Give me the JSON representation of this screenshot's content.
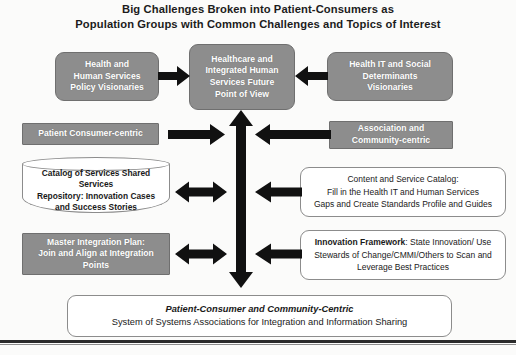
{
  "title": {
    "line1": "Big Challenges Broken into  Patient-Consumers as",
    "line2": "Population Groups with Common  Challenges and Topics of Interest"
  },
  "colors": {
    "gray_fill": "#8d8d8d",
    "gray_border": "#6f6f6f",
    "white_fill": "#ffffff",
    "white_border": "#8c8c8c",
    "arrow_fill": "#111111",
    "text_dark": "#1a1a1a",
    "text_light": "#ffffff"
  },
  "nodes": {
    "hhs_policy": {
      "lines": [
        "Health  and",
        "Human Services",
        "Policy Visionaries"
      ]
    },
    "center_vision": {
      "lines": [
        "Healthcare and",
        "Integrated Human",
        "Services Future",
        "Point of View"
      ]
    },
    "health_it_social": {
      "lines": [
        "Health IT and Social",
        "Determinants",
        "Visionaries"
      ]
    },
    "patient_consumer_centric": {
      "lines": [
        "Patient Consumer-centric"
      ]
    },
    "association_community": {
      "lines": [
        "Association and",
        "Community-centric"
      ]
    },
    "catalog_repository": {
      "lines": [
        "Catalog of Services Shared",
        "Services",
        "Repository: Innovation Cases",
        "and Success Stories"
      ]
    },
    "content_service_catalog": {
      "lines": [
        "Content and Service Catalog:",
        "Fill in the Health IT and Human Services",
        "Gaps and Create Standards Profile and Guides"
      ]
    },
    "master_integration_plan": {
      "lines": [
        "Master Integration Plan:",
        "Join and Align at Integration",
        "Points"
      ]
    },
    "innovation_framework": {
      "bold_lead": "Innovation Framework",
      "rest_line1": ": State Innovation/ Use",
      "line2": "Stewards of Change/CMMI/Others to Scan and",
      "line3": "Leverage Best Practices"
    },
    "bottom_summary": {
      "line1": "Patient-Consumer and Community-Centric",
      "line2": "System of Systems Associations for Integration and Information Sharing"
    }
  },
  "arrows": {
    "hhs_to_center": "right",
    "healthit_to_center": "left",
    "spine": "vertical-double",
    "row2_left": "right",
    "row2_right": "left",
    "row3_left": "double",
    "row3_right": "left",
    "row4_left": "double",
    "row4_right": "left"
  }
}
